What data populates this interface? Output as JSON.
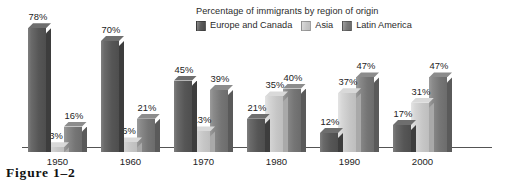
{
  "caption": "Figure 1–2",
  "chart_data": {
    "type": "bar",
    "title": "Percentage of immigrants by region of origin",
    "xlabel": "",
    "ylabel": "",
    "ylim": [
      0,
      80
    ],
    "grid": false,
    "legend_position": "top-right",
    "style": "grouped 3D columns, grayscale",
    "categories": [
      "1950",
      "1960",
      "1970",
      "1980",
      "1990",
      "2000"
    ],
    "series": [
      {
        "name": "Europe and Canada",
        "color": "#565656",
        "values": [
          78,
          70,
          45,
          21,
          12,
          17
        ],
        "labels": [
          "78%",
          "70%",
          "45%",
          "21%",
          "12%",
          "17%"
        ]
      },
      {
        "name": "Asia",
        "color": "#c6c6c6",
        "values": [
          3,
          6,
          13,
          35,
          37,
          31
        ],
        "labels": [
          "3%",
          "6%",
          "13%",
          "35%",
          "37%",
          "31%"
        ]
      },
      {
        "name": "Latin America",
        "color": "#757575",
        "values": [
          16,
          21,
          39,
          40,
          47,
          47
        ],
        "labels": [
          "16%",
          "21%",
          "39%",
          "40%",
          "47%",
          "47%"
        ]
      }
    ]
  }
}
